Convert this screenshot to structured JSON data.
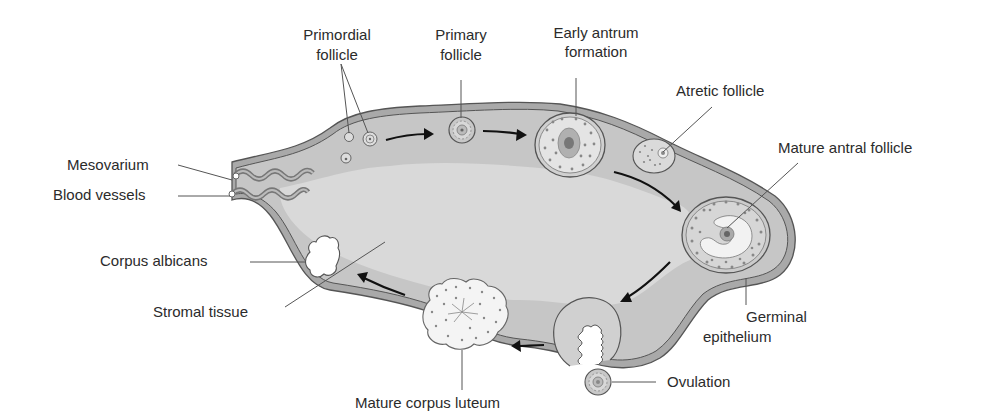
{
  "diagram": {
    "colors": {
      "background": "#ffffff",
      "cortex": "#c4c4c4",
      "medulla": "#d9d9d9",
      "capsule_line": "#555555",
      "capsule_band": "#a9a9a9",
      "text": "#2b2b2b",
      "arrow": "#111111",
      "follicle_fill": "#e6e6e6",
      "antrum_fill": "#f4f4f4"
    },
    "labels": {
      "primordial_follicle": [
        "Primordial",
        "follicle"
      ],
      "primary_follicle": [
        "Primary",
        "follicle"
      ],
      "early_antrum": [
        "Early antrum",
        "formation"
      ],
      "atretic_follicle": "Atretic follicle",
      "mature_antral_follicle": "Mature antral follicle",
      "germinal_epithelium": [
        "Germinal",
        "epithelium"
      ],
      "ovulation": "Ovulation",
      "mature_corpus_luteum": "Mature corpus luteum",
      "stromal_tissue": "Stromal tissue",
      "corpus_albicans": "Corpus albicans",
      "mesovarium": "Mesovarium",
      "blood_vessels": "Blood vessels"
    },
    "sequence": [
      "Primordial follicle",
      "Primary follicle",
      "Early antrum formation",
      "Mature antral follicle",
      "Ovulation",
      "Mature corpus luteum",
      "Corpus albicans"
    ]
  }
}
